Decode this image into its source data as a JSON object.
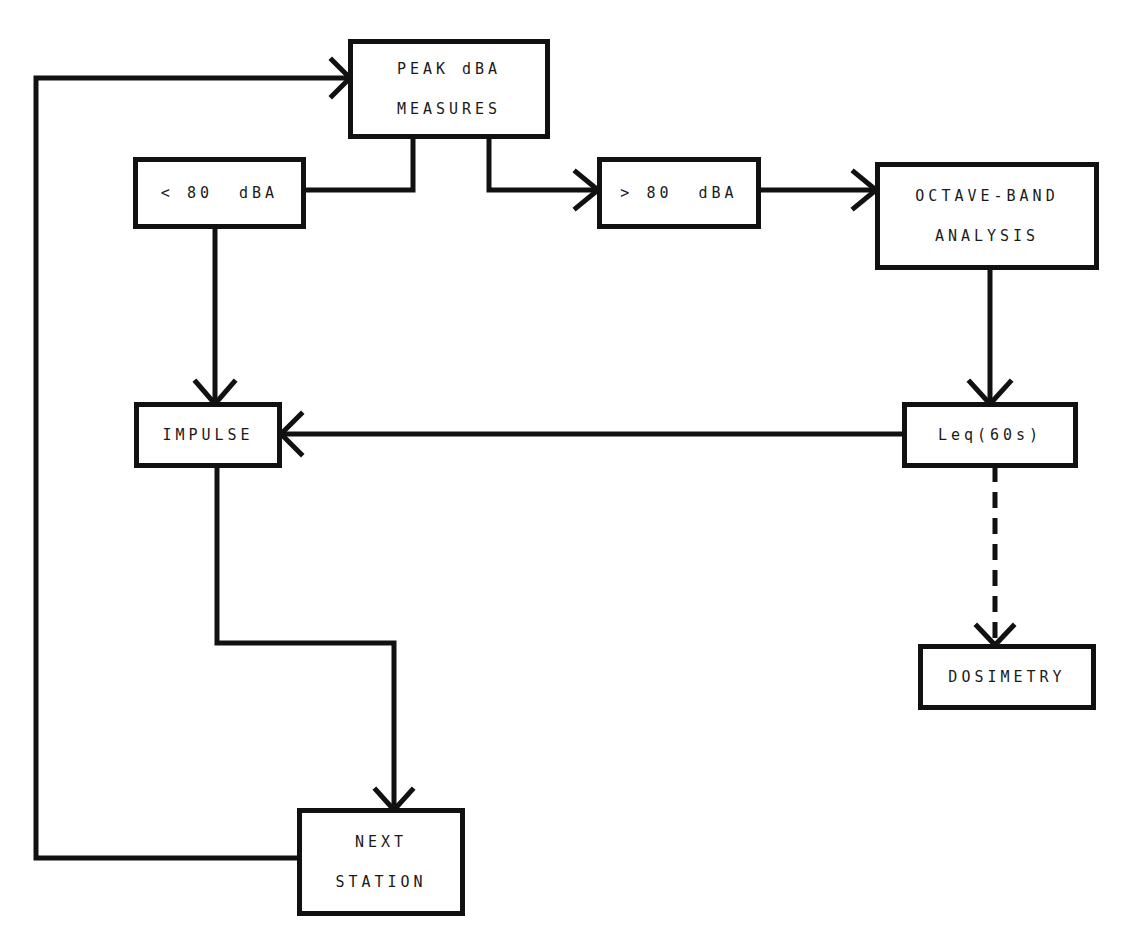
{
  "diagram": {
    "colors": {
      "line": "#111111",
      "background": "#ffffff",
      "text": "#1a1a1a"
    },
    "nodes": {
      "peak": {
        "line1": "PEAK dBA",
        "line2": "MEASURES"
      },
      "lt80": {
        "label": "< 80  dBA"
      },
      "gt80": {
        "label": "> 80  dBA"
      },
      "octave": {
        "line1": "OCTAVE-BAND",
        "line2": "ANALYSIS"
      },
      "impulse": {
        "label": "IMPULSE"
      },
      "leq": {
        "label": "Leq(60s)"
      },
      "dosimetry": {
        "label": "DOSIMETRY"
      },
      "next": {
        "line1": "NEXT",
        "line2": "STATION"
      }
    },
    "edges": [
      {
        "from": "peak",
        "to": "lt80",
        "style": "solid"
      },
      {
        "from": "peak",
        "to": "gt80",
        "style": "solid"
      },
      {
        "from": "gt80",
        "to": "octave",
        "style": "solid"
      },
      {
        "from": "octave",
        "to": "leq",
        "style": "solid"
      },
      {
        "from": "lt80",
        "to": "impulse",
        "style": "solid"
      },
      {
        "from": "leq",
        "to": "impulse",
        "style": "solid"
      },
      {
        "from": "leq",
        "to": "dosimetry",
        "style": "dashed"
      },
      {
        "from": "impulse",
        "to": "next",
        "style": "solid"
      },
      {
        "from": "next",
        "to": "peak",
        "style": "solid"
      }
    ]
  }
}
